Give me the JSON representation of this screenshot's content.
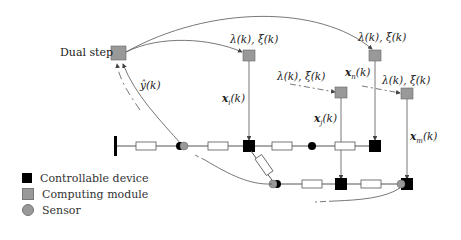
{
  "diagram": {
    "dual_step": {
      "label": "Dual step"
    },
    "feedback_label": "ŷ(k)",
    "dual_labels": [
      {
        "id": "i",
        "text": "λ(k), ξ(k)"
      },
      {
        "id": "n",
        "text": "λ(k), ξ(k)"
      },
      {
        "id": "j",
        "text": "λ(k), ξ(k)"
      },
      {
        "id": "m",
        "text": "λ(k), ξ(k)"
      }
    ],
    "primal_labels": [
      {
        "id": "i",
        "text": "x",
        "sub": "i",
        "arg": "(k)"
      },
      {
        "id": "n",
        "text": "x",
        "sub": "n",
        "arg": "(k)"
      },
      {
        "id": "j",
        "text": "x",
        "sub": "j",
        "arg": "(k)"
      },
      {
        "id": "m",
        "text": "x",
        "sub": "m",
        "arg": "(k)"
      }
    ],
    "colors": {
      "controllable_device": "#000000",
      "computing_module": "#999999",
      "sensor": "#999999",
      "line": "#555555"
    }
  },
  "legend": {
    "items": [
      {
        "label": "Controllable device",
        "shape": "square",
        "color": "#000000"
      },
      {
        "label": "Computing module",
        "shape": "square",
        "color": "#999999"
      },
      {
        "label": "Sensor",
        "shape": "circle",
        "color": "#999999"
      }
    ]
  }
}
